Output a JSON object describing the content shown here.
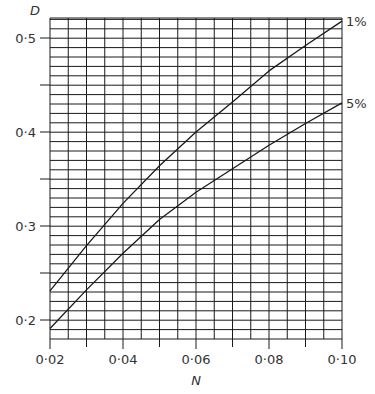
{
  "chart_data": {
    "type": "line",
    "title": "",
    "xlabel": "N",
    "ylabel": "D",
    "xlim": [
      0.02,
      0.1
    ],
    "ylim": [
      0.18,
      0.521
    ],
    "grid": true,
    "grid_x_step": 0.005,
    "grid_y_step": 0.01,
    "x_ticks": [
      0.02,
      0.04,
      0.06,
      0.08,
      0.1
    ],
    "x_tick_labels": [
      "0·02",
      "0·04",
      "0·06",
      "0·08",
      "0·10"
    ],
    "y_ticks": [
      0.2,
      0.3,
      0.4,
      0.5
    ],
    "y_tick_labels": [
      "0·2",
      "0·3",
      "0·4",
      "0·5"
    ],
    "x_minor_ticks": [
      0.03,
      0.05,
      0.07,
      0.09
    ],
    "y_minor_ticks": [
      0.25,
      0.35,
      0.45
    ],
    "legend_position": "right-end labels",
    "x": [
      0.02,
      0.03,
      0.04,
      0.05,
      0.06,
      0.07,
      0.08,
      0.09,
      0.1
    ],
    "series": [
      {
        "name": "1%",
        "values": [
          0.231,
          0.279,
          0.324,
          0.364,
          0.4,
          0.432,
          0.465,
          0.492,
          0.518
        ]
      },
      {
        "name": "5%",
        "values": [
          0.191,
          0.232,
          0.271,
          0.307,
          0.336,
          0.361,
          0.386,
          0.409,
          0.431
        ]
      }
    ]
  },
  "colors": {
    "line": "#1a1a1a",
    "grid": "#1a1a1a",
    "text": "#333333",
    "background": "#ffffff"
  }
}
